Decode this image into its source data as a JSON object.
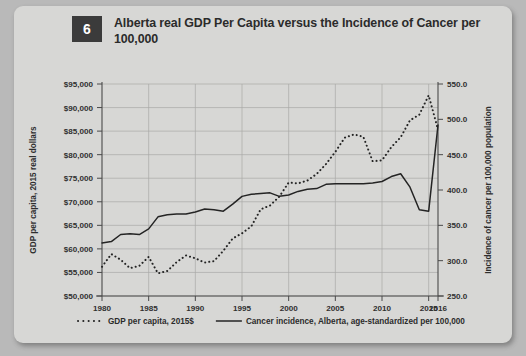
{
  "figure": {
    "number": "6",
    "title": "Alberta real GDP Per Capita versus the Incidence of Cancer per 100,000",
    "title_line1": "Alberta real GDP Per Capita versus the Incidence of Cancer",
    "title_line2": "per 100,000"
  },
  "colors": {
    "card_background": "#d7d7d5",
    "page_background": "#b9b9b9",
    "badge": "#3b3b3b",
    "badge_text": "#ffffff",
    "title_text": "#2b2b2b",
    "gridline": "#a9a9a7",
    "axis": "#4a4a4a",
    "series_ink": "#242424"
  },
  "chart_data": {
    "type": "line",
    "title": "Alberta real GDP Per Capita versus the Incidence of Cancer per 100,000",
    "xlabel": "",
    "ylabel": "GDP per capita, 2015 real dollars",
    "y2label": "Incidence of cancer per 100,000 population",
    "grid": true,
    "legend_position": "bottom",
    "xlim": [
      1980,
      2016
    ],
    "ylim": [
      50000,
      95000
    ],
    "y2lim": [
      250.0,
      550.0
    ],
    "xticks": [
      1980,
      1985,
      1990,
      1995,
      2000,
      2005,
      2010,
      2015,
      2016
    ],
    "xticklabels": [
      "1980",
      "1985",
      "1990",
      "1995",
      "2000",
      "2005",
      "2010",
      "2015",
      "2016"
    ],
    "yticks": [
      50000,
      55000,
      60000,
      65000,
      70000,
      75000,
      80000,
      85000,
      90000,
      95000
    ],
    "yticklabels": [
      "$50,000",
      "$55,000",
      "$60,000",
      "$65,000",
      "$70,000",
      "$75,000",
      "$80,000",
      "$85,000",
      "$90,000",
      "$95,000"
    ],
    "y2ticks": [
      250.0,
      300.0,
      350.0,
      400.0,
      450.0,
      500.0,
      550.0
    ],
    "y2ticklabels": [
      "250.0",
      "300.0",
      "350.0",
      "400.0",
      "450.0",
      "500.0",
      "550.0"
    ],
    "x": [
      1980,
      1981,
      1982,
      1983,
      1984,
      1985,
      1986,
      1987,
      1988,
      1989,
      1990,
      1991,
      1992,
      1993,
      1994,
      1995,
      1996,
      1997,
      1998,
      1999,
      2000,
      2001,
      2002,
      2003,
      2004,
      2005,
      2006,
      2007,
      2008,
      2009,
      2010,
      2011,
      2012,
      2013,
      2014,
      2015,
      2016
    ],
    "series": [
      {
        "name": "GDP per capita, 2015$",
        "axis": "left",
        "style": "dotted",
        "units": "2015 real dollars",
        "values": [
          56200,
          58900,
          57700,
          55900,
          56400,
          58300,
          54800,
          55300,
          57200,
          58600,
          58000,
          57100,
          57400,
          59600,
          62200,
          63300,
          64800,
          68400,
          69200,
          71100,
          74100,
          73900,
          74500,
          75900,
          78000,
          80600,
          83600,
          84300,
          83800,
          78600,
          78800,
          81600,
          83700,
          87300,
          88500,
          92600,
          85300
        ]
      },
      {
        "name": "Cancer incidence, Alberta, age-standardized per 100,000",
        "axis": "right",
        "style": "solid",
        "units": "per 100,000 population",
        "values": [
          325.0,
          327.0,
          337.0,
          338.0,
          337.0,
          345.0,
          362.0,
          365.0,
          366.0,
          366.0,
          369.0,
          373.0,
          372.0,
          370.0,
          380.0,
          391.0,
          394.0,
          395.0,
          396.0,
          391.0,
          393.0,
          398.0,
          401.0,
          402.0,
          408.0,
          409.0,
          409.0,
          409.0,
          409.0,
          410.0,
          412.0,
          419.0,
          423.0,
          404.0,
          372.0,
          370.0,
          492.0
        ]
      }
    ],
    "legend": [
      {
        "label": "GDP per capita, 2015$",
        "style": "dotted"
      },
      {
        "label": "Cancer incidence, Alberta, age-standardized per 100,000",
        "style": "solid"
      }
    ]
  }
}
